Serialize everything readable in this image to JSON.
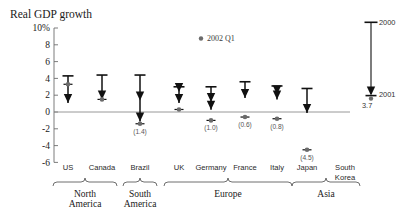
{
  "chart_data": {
    "type": "bar",
    "title": "Real GDP growth",
    "ylabel": "",
    "xlabel": "",
    "ylim": [
      -6,
      10
    ],
    "yticks": [
      10,
      8,
      6,
      4,
      2,
      0,
      -2,
      -4,
      -6
    ],
    "ytick_labels": [
      "10%",
      "8",
      "6",
      "4",
      "2",
      "0",
      "-2",
      "-4",
      "-6"
    ],
    "grid": false,
    "zero_line": true,
    "legend_position": "right",
    "annotation_2002q1": "2002 Q1",
    "categories": [
      "US",
      "Canada",
      "Brazil",
      "UK",
      "Germany",
      "France",
      "Italy",
      "Japan",
      "South Korea"
    ],
    "series": [
      {
        "name": "2000",
        "values": [
          4.3,
          4.4,
          4.4,
          3.0,
          3.0,
          3.6,
          3.1,
          2.8,
          null
        ]
      },
      {
        "name": "2001",
        "values": [
          1.2,
          1.6,
          -1.0,
          1.2,
          0.4,
          1.8,
          1.6,
          0.0,
          null
        ]
      },
      {
        "name": "2002 Q1",
        "values": [
          3.3,
          1.5,
          -1.4,
          0.3,
          -1.0,
          -0.6,
          -0.8,
          -4.5,
          null
        ]
      }
    ],
    "value_labels": [
      {
        "category": "Brazil",
        "text": "(1.4)",
        "value": -1.4
      },
      {
        "category": "Germany",
        "text": "(1.0)",
        "value": -1.0
      },
      {
        "category": "France",
        "text": "(0.6)",
        "value": -0.6
      },
      {
        "category": "Italy",
        "text": "(0.8)",
        "value": -0.8
      },
      {
        "category": "Japan",
        "text": "(4.5)",
        "value": -4.5
      }
    ],
    "intermediate_arrows": [
      {
        "category": "Brazil",
        "value": 1.5
      },
      {
        "category": "UK",
        "value": 2.5
      },
      {
        "category": "Germany",
        "value": 1.3
      },
      {
        "category": "Italy",
        "value": 2.2
      }
    ],
    "regions": [
      {
        "label_line1": "North",
        "label_line2": "America",
        "from": "US",
        "to": "Canada"
      },
      {
        "label_line1": "South",
        "label_line2": "America",
        "from": "Brazil",
        "to": "Brazil"
      },
      {
        "label_line1": "Europe",
        "label_line2": "",
        "from": "UK",
        "to": "Italy"
      },
      {
        "label_line1": "Asia",
        "label_line2": "",
        "from": "Japan",
        "to": "South Korea"
      }
    ],
    "key": {
      "top_label": "2000",
      "bottom_label": "2001",
      "dot_label": "3.7"
    }
  },
  "colors": {
    "bar": "#111111",
    "dot": "#6b6b6b",
    "axis": "#8c8c8c",
    "text": "#1a1a1a",
    "muted_text": "#555555",
    "background": "#ffffff"
  }
}
